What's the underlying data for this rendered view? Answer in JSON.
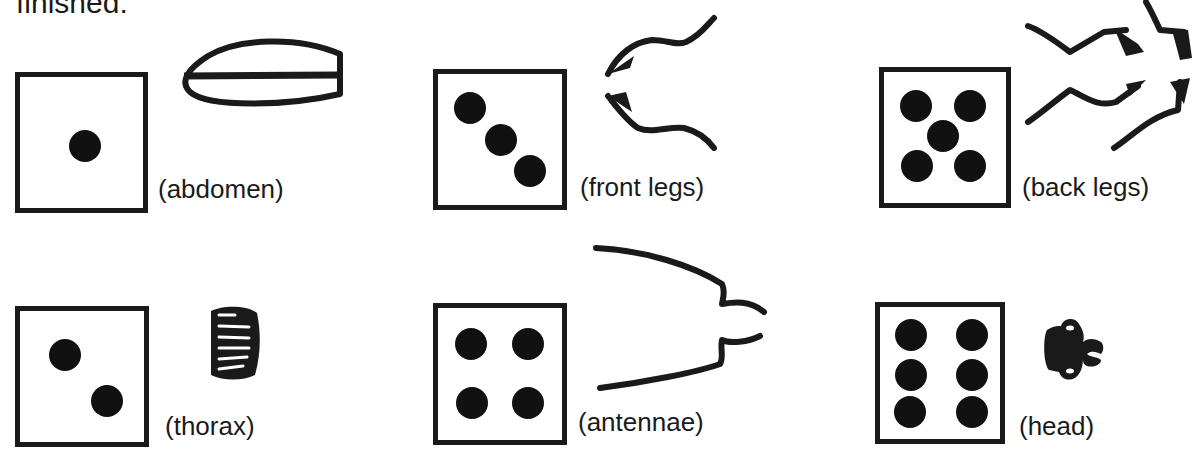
{
  "heading": {
    "text": "finished:"
  },
  "items": [
    {
      "die_value": 1,
      "part": "abdomen",
      "label": "(abdomen)",
      "icon": "beetle-abdomen-icon"
    },
    {
      "die_value": 3,
      "part": "front legs",
      "label": "(front legs)",
      "icon": "beetle-front-legs-icon"
    },
    {
      "die_value": 5,
      "part": "back legs",
      "label": "(back legs)",
      "icon": "beetle-back-legs-icon"
    },
    {
      "die_value": 2,
      "part": "thorax",
      "label": "(thorax)",
      "icon": "beetle-thorax-icon"
    },
    {
      "die_value": 4,
      "part": "antennae",
      "label": "(antennae)",
      "icon": "beetle-antennae-icon"
    },
    {
      "die_value": 6,
      "part": "head",
      "label": "(head)",
      "icon": "beetle-head-icon"
    }
  ],
  "colors": {
    "ink": "#1a1a1a",
    "background": "#ffffff"
  }
}
